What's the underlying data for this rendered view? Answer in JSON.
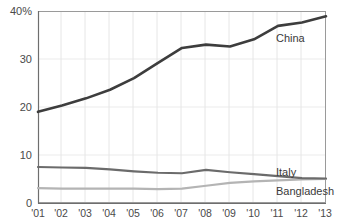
{
  "chart_data": {
    "type": "line",
    "title": "",
    "subtitle": "",
    "xlabel": "",
    "ylabel": "",
    "x": [
      "'01",
      "'02",
      "'03",
      "'04",
      "'05",
      "'06",
      "'07",
      "'08",
      "'09",
      "'10",
      "'11",
      "'12",
      "'13"
    ],
    "xlim": [
      0,
      12
    ],
    "ylim": [
      0,
      40
    ],
    "yticks": [
      0,
      10,
      20,
      30,
      40
    ],
    "ytick_labels": [
      "0",
      "10",
      "20",
      "30",
      "40%"
    ],
    "grid": "both",
    "legend": "inline-right-of-line-end",
    "series": [
      {
        "name": "China",
        "color": "#3d3d3d",
        "width": 2.6,
        "label_x": "'11",
        "values": [
          19.0,
          20.3,
          21.8,
          23.6,
          26.0,
          29.2,
          32.3,
          33.0,
          32.6,
          34.1,
          36.9,
          37.6,
          38.9
        ]
      },
      {
        "name": "Italy",
        "color": "#6b6b6b",
        "width": 2.2,
        "label_x": "'11",
        "values": [
          7.5,
          7.4,
          7.3,
          7.0,
          6.6,
          6.3,
          6.2,
          6.9,
          6.4,
          6.0,
          5.6,
          5.2,
          5.1
        ]
      },
      {
        "name": "Bangladesh",
        "color": "#b4b4b4",
        "width": 2.2,
        "label_x": "'11",
        "values": [
          3.1,
          3.0,
          3.0,
          3.0,
          3.0,
          2.9,
          3.0,
          3.6,
          4.2,
          4.5,
          4.7,
          4.9,
          5.0
        ]
      }
    ]
  },
  "axes": {
    "ytick_labels": [
      "40%",
      "30",
      "20",
      "10",
      "0"
    ],
    "xtick_labels": [
      "'01",
      "'02",
      "'03",
      "'04",
      "'05",
      "'06",
      "'07",
      "'08",
      "'09",
      "'10",
      "'11",
      "'12",
      "'13"
    ]
  },
  "labels": {
    "china": "China",
    "italy": "Italy",
    "bangladesh": "Bangladesh"
  },
  "colors": {
    "china": "#3d3d3d",
    "italy": "#6b6b6b",
    "bangladesh": "#b4b4b4",
    "frame": "#9a9a9a",
    "gridline": "#e6e6e6",
    "text": "#4a4a4a",
    "background": "#ffffff"
  }
}
